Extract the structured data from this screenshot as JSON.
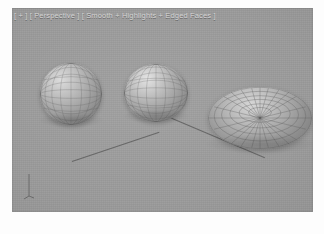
{
  "app": {
    "kind": "3d-modeling-viewport-screenshot",
    "background_color": "#ffffff"
  },
  "viewport": {
    "label_full": "[ + ] [ Perspective ] [ Smooth + Highlights + Edged Faces ]",
    "segments": {
      "expand": "[ + ]",
      "view": "[ Perspective ]",
      "shading": "[ Smooth + Highlights + Edged Faces ]"
    },
    "background_color": "#9b9b9b",
    "label_color": "#d8d8d8",
    "wire_color": "#5e5e5e",
    "line_color": "#5c5c5c"
  },
  "scene": {
    "object_count": 3,
    "objects": [
      {
        "name": "sphere-left",
        "type": "sphere",
        "display": "Smooth + Highlights + Edged Faces",
        "wireframe": "visible"
      },
      {
        "name": "sphere-middle",
        "type": "sphere",
        "display": "Smooth + Highlights + Edged Faces",
        "wireframe": "visible"
      },
      {
        "name": "ellipsoid-right",
        "type": "flattened-sphere",
        "display": "Smooth + Highlights + Edged Faces",
        "wireframe": "visible"
      }
    ],
    "construction_lines": 2,
    "gizmo": "axis-tripod"
  }
}
